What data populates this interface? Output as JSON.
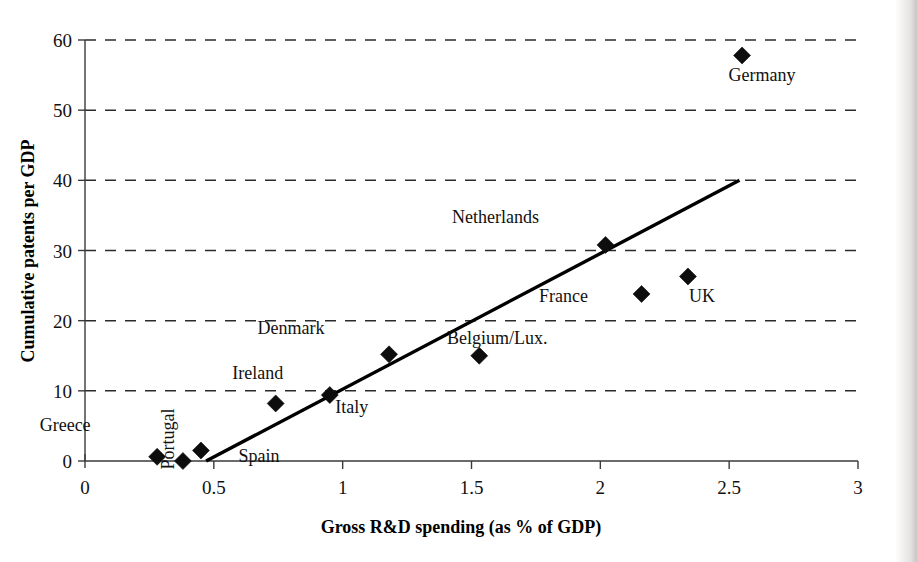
{
  "chart_data": {
    "type": "scatter",
    "title": "",
    "xlabel": "Gross R&D spending (as % of GDP)",
    "ylabel": "Cumulative patents per GDP",
    "xlim": [
      0,
      3
    ],
    "ylim": [
      0,
      60
    ],
    "xticks": [
      "0",
      "0.5",
      "1",
      "1.5",
      "2",
      "2.5",
      "3"
    ],
    "xtick_values": [
      0,
      0.5,
      1,
      1.5,
      2,
      2.5,
      3
    ],
    "yticks": [
      "0",
      "10",
      "20",
      "30",
      "40",
      "50",
      "60"
    ],
    "ytick_values": [
      0,
      10,
      20,
      30,
      40,
      50,
      60
    ],
    "grid": "horizontal-dashed",
    "legend": "none",
    "marker_shape": "diamond",
    "marker_color": "#0d0d0d",
    "points": [
      {
        "label": "Greece",
        "x": 0.28,
        "y": 0.6,
        "label_dx": -92,
        "label_dy": -26,
        "rotate": 0
      },
      {
        "label": "Portugal",
        "x": 0.38,
        "y": 0.0,
        "label_dx": -9,
        "label_dy": -22,
        "rotate": -90
      },
      {
        "label": "Spain",
        "x": 0.45,
        "y": 1.5,
        "label_dx": 58,
        "label_dy": 12,
        "rotate": 0
      },
      {
        "label": "Ireland",
        "x": 0.74,
        "y": 8.2,
        "label_dx": -18,
        "label_dy": -24,
        "rotate": 0
      },
      {
        "label": "Italy",
        "x": 0.95,
        "y": 9.4,
        "label_dx": 22,
        "label_dy": 18,
        "rotate": 0
      },
      {
        "label": "Denmark",
        "x": 1.18,
        "y": 15.2,
        "label_dx": -98,
        "label_dy": -20,
        "rotate": 0
      },
      {
        "label": "Belgium/Lux.",
        "x": 1.53,
        "y": 15.0,
        "label_dx": 18,
        "label_dy": -12,
        "rotate": 0
      },
      {
        "label": "Netherlands",
        "x": 2.02,
        "y": 30.8,
        "label_dx": -110,
        "label_dy": -22,
        "rotate": 0
      },
      {
        "label": "France",
        "x": 2.16,
        "y": 23.8,
        "label_dx": -78,
        "label_dy": 8,
        "rotate": 0
      },
      {
        "label": "UK",
        "x": 2.34,
        "y": 26.3,
        "label_dx": 14,
        "label_dy": 26,
        "rotate": 0
      },
      {
        "label": "Germany",
        "x": 2.55,
        "y": 57.8,
        "label_dx": 20,
        "label_dy": 26,
        "rotate": 0
      }
    ],
    "trendline": {
      "x_start": 0.47,
      "y_start": 0.0,
      "x_end": 2.54,
      "y_end": 40.0
    }
  }
}
